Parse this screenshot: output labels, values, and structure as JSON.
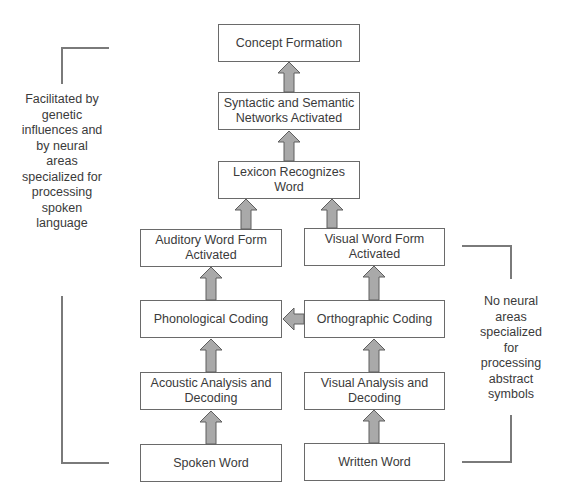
{
  "diagram": {
    "boxes": {
      "concept_formation": "Concept Formation",
      "syntactic_semantic": "Syntactic and Semantic Networks Activated",
      "lexicon": "Lexicon Recognizes Word",
      "auditory_word_form": "Auditory Word Form Activated",
      "visual_word_form": "Visual Word Form Activated",
      "phonological_coding": "Phonological Coding",
      "orthographic_coding": "Orthographic Coding",
      "acoustic_analysis": "Acoustic Analysis and Decoding",
      "visual_analysis": "Visual Analysis and Decoding",
      "spoken_word": "Spoken Word",
      "written_word": "Written Word"
    },
    "annotations": {
      "left": "Facilitated by genetic influences and by neural areas specialized for processing spoken language",
      "right": "No neural areas specialized for processing abstract symbols"
    },
    "colors": {
      "box_border": "#6a6a6a",
      "arrow_fill": "#a9a9a9",
      "arrow_stroke": "#5e5e5e",
      "bracket": "#7a7a7a"
    }
  }
}
